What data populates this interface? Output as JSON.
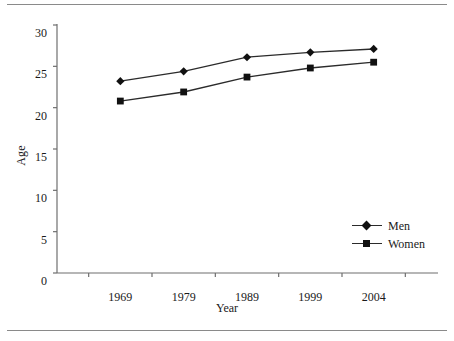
{
  "chart_data": {
    "type": "line",
    "title": "",
    "xlabel": "Year",
    "ylabel": "Age",
    "categories": [
      "1969",
      "1979",
      "1989",
      "1999",
      "2004"
    ],
    "x": [
      1969,
      1979,
      1989,
      1999,
      2004
    ],
    "series": [
      {
        "name": "Men",
        "marker": "diamond",
        "color": "#111111",
        "values": [
          23.2,
          24.4,
          26.1,
          26.7,
          27.1
        ]
      },
      {
        "name": "Women",
        "marker": "square",
        "color": "#111111",
        "values": [
          20.8,
          21.9,
          23.7,
          24.8,
          25.5
        ]
      }
    ],
    "ylim": [
      0,
      30
    ],
    "yticks": [
      "0",
      "5",
      "10",
      "15",
      "20",
      "25",
      "30"
    ],
    "ytick_values": [
      0,
      5,
      10,
      15,
      20,
      25,
      30
    ],
    "xticks": [
      "1969",
      "1979",
      "1989",
      "1999",
      "2004"
    ],
    "grid": false,
    "legend_position": "center-right",
    "line_color": "#2b2b2b",
    "axis_color": "#6f6f6f"
  },
  "legend": {
    "entries": [
      {
        "label": "Men",
        "marker": "diamond-marker"
      },
      {
        "label": "Women",
        "marker": "square-marker"
      }
    ]
  },
  "axes": {
    "y_title": "Age",
    "x_title": "Year"
  }
}
